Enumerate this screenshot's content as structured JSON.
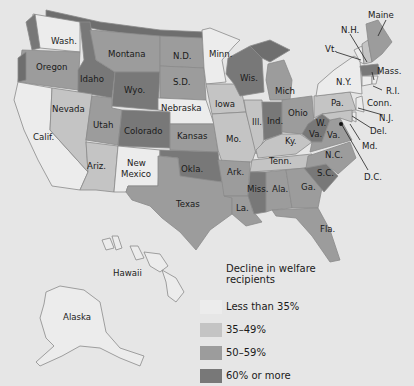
{
  "legend": {
    "title": "Decline in welfare recipients",
    "items": [
      {
        "label": "Less than 35%",
        "color": "#ececec"
      },
      {
        "label": "35–49%",
        "color": "#c4c4c4"
      },
      {
        "label": "50–59%",
        "color": "#9c9c9c"
      },
      {
        "label": "60% or more",
        "color": "#787878"
      }
    ]
  },
  "states": [
    {
      "name": "Wash.",
      "category": "Less than 35%"
    },
    {
      "name": "Oregon",
      "category": "50–59%"
    },
    {
      "name": "Calif.",
      "category": "Less than 35%"
    },
    {
      "name": "Idaho",
      "category": "60% or more"
    },
    {
      "name": "Nevada",
      "category": "35–49%"
    },
    {
      "name": "Montana",
      "category": "50–59%"
    },
    {
      "name": "Wyo.",
      "category": "60% or more"
    },
    {
      "name": "Utah",
      "category": "50–59%"
    },
    {
      "name": "Ariz.",
      "category": "35–49%"
    },
    {
      "name": "Colorado",
      "category": "60% or more"
    },
    {
      "name": "New Mexico",
      "category": "Less than 35%"
    },
    {
      "name": "N.D.",
      "category": "50–59%"
    },
    {
      "name": "S.D.",
      "category": "50–59%"
    },
    {
      "name": "Nebraska",
      "category": "Less than 35%"
    },
    {
      "name": "Kansas",
      "category": "50–59%"
    },
    {
      "name": "Okla.",
      "category": "60% or more"
    },
    {
      "name": "Texas",
      "category": "50–59%"
    },
    {
      "name": "Minn.",
      "category": "Less than 35%"
    },
    {
      "name": "Iowa",
      "category": "35–49%"
    },
    {
      "name": "Mo.",
      "category": "35–49%"
    },
    {
      "name": "Ark.",
      "category": "50–59%"
    },
    {
      "name": "La.",
      "category": "50–59%"
    },
    {
      "name": "Wis.",
      "category": "60% or more"
    },
    {
      "name": "Ill.",
      "category": "35–49%"
    },
    {
      "name": "Mich",
      "category": "50–59%"
    },
    {
      "name": "Ind.",
      "category": "60% or more"
    },
    {
      "name": "Ohio",
      "category": "50–59%"
    },
    {
      "name": "Ky.",
      "category": "35–49%"
    },
    {
      "name": "Tenn.",
      "category": "35–49%"
    },
    {
      "name": "Miss.",
      "category": "60% or more"
    },
    {
      "name": "Ala.",
      "category": "50–59%"
    },
    {
      "name": "Ga.",
      "category": "50–59%"
    },
    {
      "name": "Fla.",
      "category": "50–59%"
    },
    {
      "name": "S.C.",
      "category": "60% or more"
    },
    {
      "name": "N.C.",
      "category": "50–59%"
    },
    {
      "name": "Va.",
      "category": "50–59%"
    },
    {
      "name": "W. Va.",
      "category": "60% or more"
    },
    {
      "name": "Pa.",
      "category": "35–49%"
    },
    {
      "name": "N.Y.",
      "category": "Less than 35%"
    },
    {
      "name": "Vt.",
      "category": "Less than 35%"
    },
    {
      "name": "N.H.",
      "category": "35–49%"
    },
    {
      "name": "Maine",
      "category": "50–59%"
    },
    {
      "name": "Mass.",
      "category": "60% or more"
    },
    {
      "name": "R.I.",
      "category": "Less than 35%"
    },
    {
      "name": "Conn.",
      "category": "Less than 35%"
    },
    {
      "name": "N.J.",
      "category": "Less than 35%"
    },
    {
      "name": "Del.",
      "category": "Less than 35%"
    },
    {
      "name": "Md.",
      "category": "35–49%"
    },
    {
      "name": "D.C.",
      "category": "60% or more"
    },
    {
      "name": "Alaska",
      "category": "Less than 35%"
    },
    {
      "name": "Hawaii",
      "category": "Less than 35%"
    }
  ],
  "labels": {
    "wash": "Wash.",
    "oregon": "Oregon",
    "calif": "Calif.",
    "idaho": "Idaho",
    "nevada": "Nevada",
    "montana": "Montana",
    "wyo": "Wyo.",
    "utah": "Utah",
    "ariz": "Ariz.",
    "colorado": "Colorado",
    "newmex1": "New",
    "newmex2": "Mexico",
    "nd": "N.D.",
    "sd": "S.D.",
    "nebraska": "Nebraska",
    "kansas": "Kansas",
    "okla": "Okla.",
    "texas": "Texas",
    "minn": "Minn.",
    "iowa": "Iowa",
    "mo": "Mo.",
    "ark": "Ark.",
    "la": "La.",
    "wis": "Wis.",
    "ill": "Ill.",
    "mich": "Mich",
    "ind": "Ind.",
    "ohio": "Ohio",
    "ky": "Ky.",
    "tenn": "Tenn.",
    "miss": "Miss.",
    "ala": "Ala.",
    "ga": "Ga.",
    "fla": "Fla.",
    "sc": "S.C.",
    "nc": "N.C.",
    "va": "Va.",
    "wva1": "W.",
    "wva2": "Va.",
    "pa": "Pa.",
    "ny": "N.Y.",
    "vt": "Vt.",
    "nh": "N.H.",
    "maine": "Maine",
    "mass": "Mass.",
    "ri": "R.I.",
    "conn": "Conn.",
    "nj": "N.J.",
    "del": "Del.",
    "md": "Md.",
    "dc": "D.C.",
    "alaska": "Alaska",
    "hawaii": "Hawaii"
  }
}
